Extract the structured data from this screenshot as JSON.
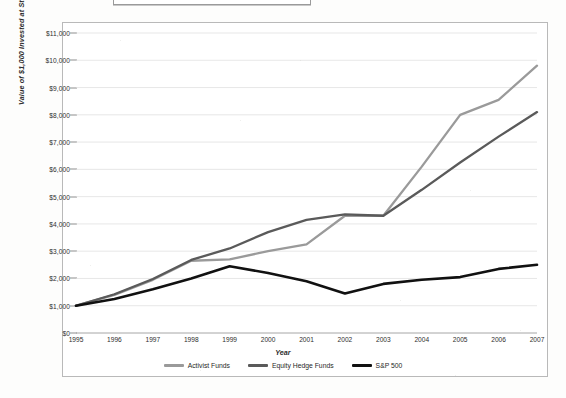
{
  "chart_data": {
    "type": "line",
    "title": "",
    "xlabel": "Year",
    "ylabel": "Value of $1,000 Invested at Start of 1995",
    "x": [
      1995,
      1996,
      1997,
      1998,
      1999,
      2000,
      2001,
      2002,
      2003,
      2004,
      2005,
      2006,
      2007
    ],
    "xtick_labels": [
      "1995",
      "1996",
      "1997",
      "1998",
      "1999",
      "2000",
      "2001",
      "2002",
      "2003",
      "2004",
      "2005",
      "2006",
      "2007"
    ],
    "ytick_labels": [
      "$0",
      "$1,000",
      "$2,000",
      "$3,000",
      "$4,000",
      "$5,000",
      "$6,000",
      "$7,000",
      "$8,000",
      "$9,000",
      "$10,000",
      "$11,000"
    ],
    "ytick_values": [
      0,
      1000,
      2000,
      3000,
      4000,
      5000,
      6000,
      7000,
      8000,
      9000,
      10000,
      11000
    ],
    "ylim": [
      0,
      11000
    ],
    "xlim": [
      1995,
      2007
    ],
    "grid": "horizontal",
    "legend_position": "bottom",
    "series": [
      {
        "name": "Activist Funds",
        "color": "#9a9a9a",
        "values": [
          1000,
          1400,
          1950,
          2650,
          2700,
          3000,
          3250,
          4300,
          4300,
          6100,
          8000,
          8550,
          9800
        ]
      },
      {
        "name": "Equity Hedge Funds",
        "color": "#5a5a5a",
        "values": [
          1000,
          1420,
          1980,
          2680,
          3100,
          3700,
          4150,
          4350,
          4300,
          5250,
          6250,
          7200,
          8100
        ]
      },
      {
        "name": "S&P 500",
        "color": "#111111",
        "values": [
          1000,
          1250,
          1600,
          2000,
          2450,
          2200,
          1900,
          1450,
          1800,
          1950,
          2050,
          2350,
          2500
        ]
      }
    ]
  },
  "legend": {
    "items": [
      {
        "label": "Activist Funds",
        "color": "#9a9a9a"
      },
      {
        "label": "Equity Hedge Funds",
        "color": "#5a5a5a"
      },
      {
        "label": "S&P 500",
        "color": "#111111"
      }
    ]
  },
  "axes": {
    "x_title": "Year",
    "y_title": "Value of $1,000 Invested at Start of 1995"
  }
}
